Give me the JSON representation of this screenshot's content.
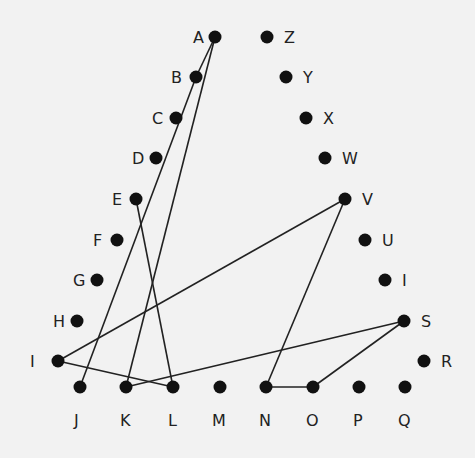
{
  "nodes": [
    {
      "id": "A",
      "x": 215,
      "y": 37,
      "lx": 193,
      "ly": 43
    },
    {
      "id": "B",
      "x": 196,
      "y": 77,
      "lx": 171,
      "ly": 83
    },
    {
      "id": "C",
      "x": 176,
      "y": 118,
      "lx": 152,
      "ly": 124
    },
    {
      "id": "D",
      "x": 156,
      "y": 158,
      "lx": 132,
      "ly": 164
    },
    {
      "id": "E",
      "x": 136,
      "y": 199,
      "lx": 112,
      "ly": 205
    },
    {
      "id": "F",
      "x": 117,
      "y": 240,
      "lx": 93,
      "ly": 246
    },
    {
      "id": "G",
      "x": 97,
      "y": 280,
      "lx": 73,
      "ly": 286
    },
    {
      "id": "H",
      "x": 77,
      "y": 321,
      "lx": 53,
      "ly": 327
    },
    {
      "id": "I",
      "x": 58,
      "y": 361,
      "lx": 30,
      "ly": 367
    },
    {
      "id": "J",
      "x": 80,
      "y": 387,
      "lx": 74,
      "ly": 426
    },
    {
      "id": "K",
      "x": 126,
      "y": 387,
      "lx": 120,
      "ly": 426
    },
    {
      "id": "L",
      "x": 173,
      "y": 387,
      "lx": 168,
      "ly": 426
    },
    {
      "id": "M",
      "x": 220,
      "y": 387,
      "lx": 212,
      "ly": 426
    },
    {
      "id": "N",
      "x": 266,
      "y": 387,
      "lx": 259,
      "ly": 426
    },
    {
      "id": "O",
      "x": 313,
      "y": 387,
      "lx": 306,
      "ly": 426
    },
    {
      "id": "P",
      "x": 359,
      "y": 387,
      "lx": 353,
      "ly": 426
    },
    {
      "id": "Q",
      "x": 405,
      "y": 387,
      "lx": 398,
      "ly": 426
    },
    {
      "id": "R",
      "x": 424,
      "y": 361,
      "lx": 441,
      "ly": 367
    },
    {
      "id": "S",
      "x": 404,
      "y": 321,
      "lx": 421,
      "ly": 327
    },
    {
      "id": "I2",
      "label": "I",
      "x": 385,
      "y": 280,
      "lx": 402,
      "ly": 286
    },
    {
      "id": "U",
      "x": 365,
      "y": 240,
      "lx": 382,
      "ly": 246
    },
    {
      "id": "V",
      "x": 345,
      "y": 199,
      "lx": 362,
      "ly": 205
    },
    {
      "id": "W",
      "x": 325,
      "y": 158,
      "lx": 342,
      "ly": 164
    },
    {
      "id": "X",
      "x": 306,
      "y": 118,
      "lx": 323,
      "ly": 124
    },
    {
      "id": "Y",
      "x": 286,
      "y": 77,
      "lx": 303,
      "ly": 83
    },
    {
      "id": "Z",
      "x": 267,
      "y": 37,
      "lx": 284,
      "ly": 43
    }
  ],
  "edges": [
    [
      "A",
      "B"
    ],
    [
      "B",
      "J"
    ],
    [
      "A",
      "K"
    ],
    [
      "E",
      "L"
    ],
    [
      "I",
      "V"
    ],
    [
      "I",
      "L"
    ],
    [
      "K",
      "S"
    ],
    [
      "S",
      "O"
    ],
    [
      "O",
      "N"
    ],
    [
      "N",
      "V"
    ]
  ]
}
